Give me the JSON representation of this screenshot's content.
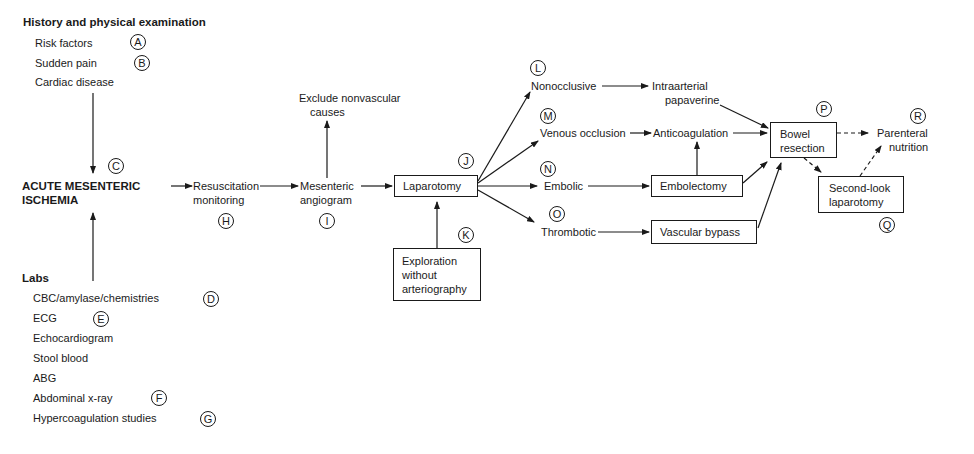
{
  "history": {
    "title": "History and physical examination",
    "items": [
      {
        "label": "Risk factors",
        "marker": "A"
      },
      {
        "label": "Sudden pain",
        "marker": "B"
      },
      {
        "label": "Cardiac disease",
        "marker": ""
      }
    ]
  },
  "labs": {
    "title": "Labs",
    "items": [
      {
        "label": "CBC/amylase/chemistries",
        "marker": "D"
      },
      {
        "label": "ECG",
        "marker": "E"
      },
      {
        "label": "Echocardiogram",
        "marker": ""
      },
      {
        "label": "Stool blood",
        "marker": ""
      },
      {
        "label": "ABG",
        "marker": ""
      },
      {
        "label": "Abdominal x-ray",
        "marker": "F"
      },
      {
        "label": "Hypercoagulation studies",
        "marker": "G"
      }
    ]
  },
  "nodes": {
    "ami": {
      "line1": "ACUTE MESENTERIC",
      "line2": "ISCHEMIA",
      "marker": "C"
    },
    "resus": {
      "line1": "Resuscitation",
      "line2": "monitoring",
      "marker": "H"
    },
    "angio": {
      "line1": "Mesenteric",
      "line2": "angiogram",
      "marker": "I"
    },
    "exclude": {
      "line1": "Exclude nonvascular",
      "line2": "causes"
    },
    "laparotomy": {
      "label": "Laparotomy",
      "marker": "J"
    },
    "exploration": {
      "line1": "Exploration",
      "line2": "without",
      "line3": "arteriography",
      "marker": "K"
    },
    "nonocclusive": {
      "label": "Nonocclusive",
      "marker": "L"
    },
    "venous": {
      "label": "Venous occlusion",
      "marker": "M"
    },
    "embolic": {
      "label": "Embolic",
      "marker": "N"
    },
    "thrombotic": {
      "label": "Thrombotic",
      "marker": "O"
    },
    "papaverine": {
      "line1": "Intraarterial",
      "line2": "papaverine"
    },
    "anticoag": {
      "label": "Anticoagulation"
    },
    "embolectomy": {
      "label": "Embolectomy"
    },
    "bypass": {
      "label": "Vascular bypass"
    },
    "bowel": {
      "line1": "Bowel",
      "line2": "resection",
      "marker": "P"
    },
    "secondlook": {
      "line1": "Second-look",
      "line2": "laparotomy",
      "marker": "Q"
    },
    "parenteral": {
      "line1": "Parenteral",
      "line2": "nutrition",
      "marker": "R"
    }
  }
}
